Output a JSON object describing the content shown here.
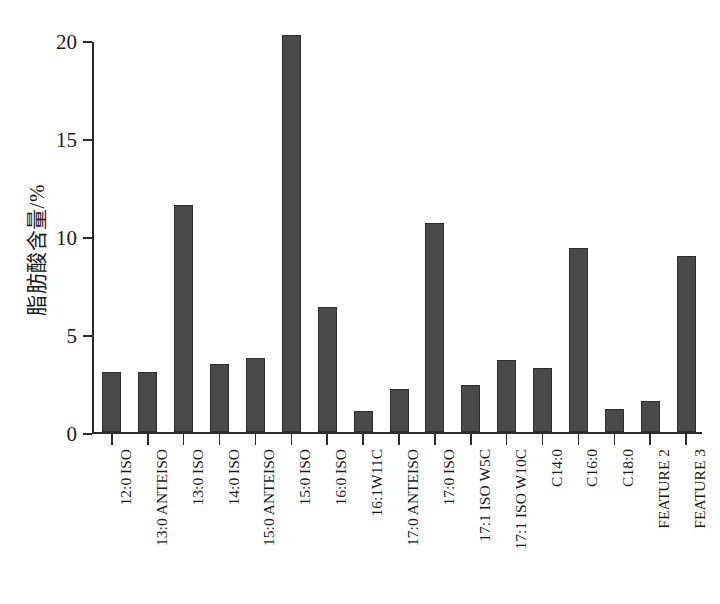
{
  "chart_data": {
    "type": "bar",
    "title": "",
    "subtitle": "",
    "xlabel": "",
    "ylabel": "脂肪酸含量/%",
    "ylim": [
      0,
      20
    ],
    "yticks": [
      0,
      5,
      10,
      15,
      20
    ],
    "ytick_labels": [
      "0",
      "5",
      "10",
      "15",
      "20"
    ],
    "grid": false,
    "legend": null,
    "bar_color": "#4a4a4a",
    "axis_color": "#2b2b2b",
    "background": "#ffffff",
    "categories": [
      "12:0 ISO",
      "13:0 ANTEISO",
      "13:0 ISO",
      "14:0 ISO",
      "15:0 ANTEISO",
      "15:0 ISO",
      "16:0 ISO",
      "16:1W11C",
      "17:0 ANTEISO",
      "17:0 ISO",
      "17:1 ISO W5C",
      "17:1 ISO W10C",
      "C14:0",
      "C16:0",
      "C18:0",
      "FEATURE 2",
      "FEATURE 3"
    ],
    "values": [
      3.1,
      3.1,
      11.6,
      3.5,
      3.8,
      20.3,
      6.4,
      1.1,
      2.2,
      10.7,
      2.4,
      3.7,
      3.3,
      9.4,
      1.2,
      1.6,
      9.0
    ]
  }
}
